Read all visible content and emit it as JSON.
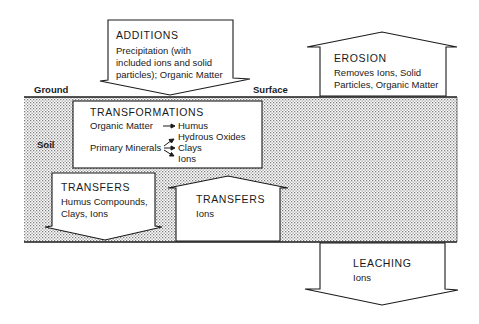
{
  "diagram": {
    "ground_label": "Ground",
    "surface_label": "Surface",
    "soil_label": "Soil",
    "colors": {
      "line": "#1a1a1a",
      "soil_dot": "#8a8a8a",
      "background": "#ffffff"
    },
    "additions": {
      "title": "ADDITIONS",
      "lines": [
        "Precipitation (with",
        "included ions and solid",
        "particles); Organic Matter"
      ],
      "direction": "down"
    },
    "erosion": {
      "title": "EROSION",
      "lines": [
        "Removes Ions, Solid",
        "Particles, Organic Matter"
      ],
      "direction": "up"
    },
    "transformations": {
      "title": "TRANSFORMATIONS",
      "organic_source": "Organic Matter",
      "organic_product": "Humus",
      "mineral_source": "Primary Minerals",
      "mineral_products": [
        "Hydrous Oxides",
        "Clays",
        "Ions"
      ]
    },
    "transfers_down": {
      "title": "TRANSFERS",
      "lines": [
        "Humus Compounds,",
        "Clays, Ions"
      ],
      "direction": "down"
    },
    "transfers_up": {
      "title": "TRANSFERS",
      "lines": [
        "Ions"
      ],
      "direction": "up"
    },
    "leaching": {
      "title": "LEACHING",
      "lines": [
        "Ions"
      ],
      "direction": "down"
    }
  }
}
